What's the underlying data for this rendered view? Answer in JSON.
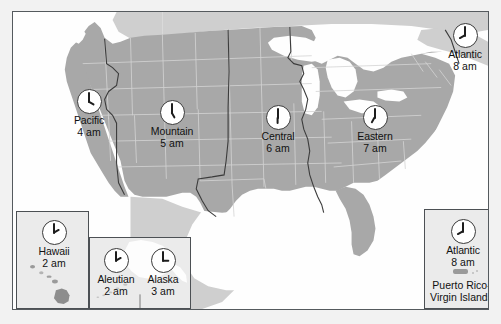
{
  "figure": {
    "background_color": "#f2f2f2",
    "land_color": "#a8a8a8",
    "water_color": "#fefefe",
    "frame_color": "#555a5e",
    "inset_color": "#ebebeb"
  },
  "zones": [
    {
      "id": "pacific",
      "label": "Pacific",
      "time": "4 am",
      "hour": 4,
      "minute": 0
    },
    {
      "id": "mountain",
      "label": "Mountain",
      "time": "5 am",
      "hour": 5,
      "minute": 0
    },
    {
      "id": "central",
      "label": "Central",
      "time": "6 am",
      "hour": 6,
      "minute": 0
    },
    {
      "id": "eastern",
      "label": "Eastern",
      "time": "7 am",
      "hour": 7,
      "minute": 0
    },
    {
      "id": "atlantic",
      "label": "Atlantic",
      "time": "8 am",
      "hour": 8,
      "minute": 0
    }
  ],
  "insets": {
    "hawaii": {
      "label": "Hawaii",
      "time": "2 am",
      "hour": 2,
      "minute": 0
    },
    "aleutian": {
      "label": "Aleutian",
      "time": "2 am",
      "hour": 2,
      "minute": 0
    },
    "alaska": {
      "label": "Alaska",
      "time": "3 am",
      "hour": 3,
      "minute": 0
    },
    "atlantic": {
      "label": "Atlantic",
      "time": "8 am",
      "hour": 8,
      "minute": 0,
      "caption_line1": "Puerto Rico-",
      "caption_line2": "Virgin Islands"
    }
  }
}
